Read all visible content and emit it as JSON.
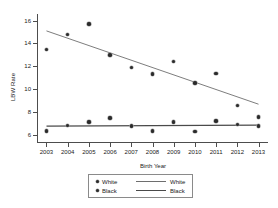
{
  "chart_data": {
    "type": "scatter",
    "title": "",
    "xlabel": "Birth Year",
    "ylabel": "LBW Rate",
    "xlim": [
      2002.6,
      2013.4
    ],
    "ylim": [
      5.4,
      16.4
    ],
    "grid": false,
    "legend_position": "bottom-center",
    "x": [
      2003,
      2004,
      2005,
      2006,
      2007,
      2008,
      2009,
      2010,
      2011,
      2012,
      2013
    ],
    "xticklabels": [
      "2003",
      "2004",
      "2005",
      "2006",
      "2007",
      "2008",
      "2009",
      "2010",
      "2011",
      "2012",
      "2013"
    ],
    "yticks": [
      6,
      8,
      10,
      12,
      14,
      16
    ],
    "yticklabels": [
      "6",
      "8",
      "10",
      "12",
      "14",
      "16"
    ],
    "series": [
      {
        "name": "White",
        "kind": "scatter",
        "values": [
          13.5,
          14.8,
          15.7,
          13.0,
          11.9,
          11.35,
          12.45,
          10.55,
          11.4,
          8.6,
          7.6
        ]
      },
      {
        "name": "Black",
        "kind": "scatter",
        "values": [
          6.35,
          6.85,
          7.15,
          7.5,
          6.8,
          6.35,
          7.15,
          6.3,
          7.25,
          6.95,
          6.8
        ]
      },
      {
        "name": "White",
        "kind": "fit-line",
        "endpoints": [
          {
            "x": 2003,
            "y": 15.1
          },
          {
            "x": 2013,
            "y": 8.7
          }
        ]
      },
      {
        "name": "Black",
        "kind": "fit-line",
        "endpoints": [
          {
            "x": 2003,
            "y": 6.78
          },
          {
            "x": 2013,
            "y": 6.88
          }
        ]
      }
    ]
  },
  "legend": {
    "rows": [
      {
        "marker_label": "White",
        "line_label": "White"
      },
      {
        "marker_label": "Black",
        "line_label": "Black"
      }
    ]
  }
}
